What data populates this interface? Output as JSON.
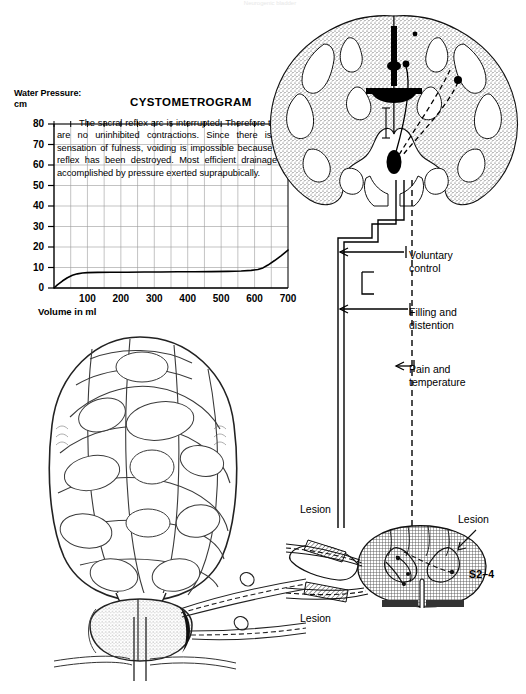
{
  "page": {
    "header_faint": "Neurogenic bladder",
    "background_color": "#ffffff",
    "ink_color": "#000000"
  },
  "chart_data": {
    "type": "line",
    "title": "CYSTOMETROGRAM",
    "xlabel": "Volume in ml",
    "ylabel": "Water Pressure:\ncm",
    "ylabel_line1": "Water Pressure:",
    "ylabel_line2": "cm",
    "xlim": [
      0,
      700
    ],
    "ylim": [
      0,
      80
    ],
    "grid": true,
    "grid_x_step": 50,
    "grid_y_step": 10,
    "ytick_labels": [
      "80",
      "70",
      "60",
      "50",
      "40",
      "30",
      "20",
      "10",
      "0"
    ],
    "ytick_values": [
      80,
      70,
      60,
      50,
      40,
      30,
      20,
      10,
      0
    ],
    "xtick_labels": [
      "100",
      "200",
      "300",
      "400",
      "500",
      "600",
      "700"
    ],
    "xtick_values": [
      100,
      200,
      300,
      400,
      500,
      600,
      700
    ],
    "legend": [],
    "series": [
      {
        "name": "Bladder pressure",
        "x": [
          0,
          10,
          25,
          40,
          55,
          70,
          85,
          100,
          130,
          170,
          220,
          270,
          320,
          370,
          420,
          470,
          520,
          560,
          590,
          610,
          625,
          640,
          660,
          680,
          700
        ],
        "y": [
          0,
          1.5,
          3.4,
          5.0,
          6.2,
          6.9,
          7.3,
          7.5,
          7.6,
          7.7,
          7.7,
          7.8,
          7.8,
          7.9,
          7.9,
          8.0,
          8.1,
          8.3,
          8.6,
          9.0,
          9.8,
          11.2,
          13.4,
          15.8,
          18.5
        ]
      }
    ],
    "annotation": "The sacral reflex arc is interrupted. Therefore there are no uninhibited contractions. Since there is no sensation of fulness, voiding is impossible because the reflex has been destroyed. Most efficient drainage is accomplished by pressure exerted suprapubically."
  },
  "diagram": {
    "tract_labels": [
      {
        "id": "voluntary",
        "text": "Voluntary\ncontrol"
      },
      {
        "id": "filling",
        "text": "Filling and\ndistention"
      },
      {
        "id": "pain",
        "text": "Pain and\ntemperature"
      }
    ],
    "lesion_labels": {
      "upper_left": "Lesion",
      "lower_left": "Lesion",
      "right": "Lesion"
    },
    "segment_label": "S2–4",
    "figures": {
      "brain": "coronal-brain-section",
      "spinal_cord": "sacral-spinal-cord-cross-section",
      "bladder": "trabeculated-bladder-and-prostate"
    }
  }
}
